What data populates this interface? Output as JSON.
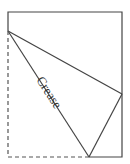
{
  "diagram": {
    "type": "paper-fold",
    "label": "Crease",
    "colors": {
      "stroke": "#444444",
      "background": "#ffffff"
    },
    "points": {
      "top_left": [
        8,
        12
      ],
      "top_right": [
        122,
        12
      ],
      "left_fold": [
        8,
        31
      ],
      "right_fold": [
        122,
        94
      ],
      "bottom_fold": [
        89,
        157
      ],
      "bottom_right": [
        122,
        157
      ],
      "bottom_left": [
        8,
        157
      ]
    }
  }
}
